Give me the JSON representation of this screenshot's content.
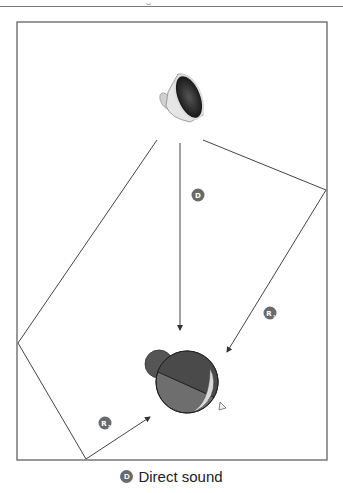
{
  "figure": {
    "type": "room acoustics diagram",
    "elements": {
      "source": "speaker-icon",
      "listener": "listener-head-icon"
    },
    "paths": [
      {
        "id": "D",
        "label": "D",
        "name": "direct sound"
      },
      {
        "id": "R1",
        "label": "R",
        "subscript": "1",
        "name": "first reflection (right wall)"
      },
      {
        "id": "R2",
        "label": "R",
        "subscript": "2",
        "name": "second reflection (left wall and floor)"
      }
    ],
    "badges": {
      "d": "D",
      "r1": "R",
      "r1_sub": "1",
      "r2": "R",
      "r2_sub": "2"
    }
  },
  "caption": {
    "badge": "D",
    "text": "Direct sound"
  },
  "colors": {
    "wall": "#555555",
    "path": "#444444",
    "badge": "#6a6a6a",
    "head_dark": "#4a4a4a",
    "head_mid": "#6e6e6e",
    "face": "#d8d8d8"
  }
}
